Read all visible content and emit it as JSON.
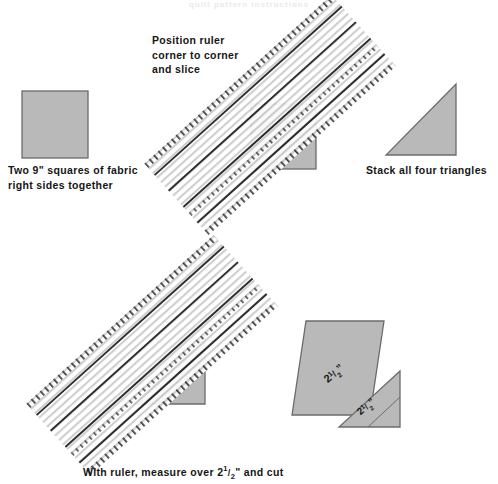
{
  "page": {
    "background_color": "#ffffff",
    "width": 498,
    "height": 484,
    "faint_header_text": "quilt pattern instructions"
  },
  "palette": {
    "fabric_fill": "#b9b9b9",
    "fabric_stroke": "#6b6b6b",
    "ruler_fill": "#ffffff",
    "ruler_hatch": "#c9c9c9",
    "ruler_guide_line": "#1f1f1f",
    "ruler_tick": "#2b2b2b",
    "text_color": "#161616"
  },
  "captions": {
    "squares": "Two 9\" squares of fabric\nright sides together",
    "position_ruler": "Position ruler\ncorner to corner\nand slice",
    "stack": "Stack all four triangles",
    "measure": "With ruler, measure over 2¹/₂\" and cut"
  },
  "measure_caption_parts": {
    "before": "With ruler, measure over ",
    "whole": "2",
    "numerator": "1",
    "slash": "/",
    "denominator": "2",
    "after": "\" and cut"
  },
  "steps": [
    {
      "id": "step-1",
      "name": "fabric-square",
      "caption_key": "squares",
      "shape": "square",
      "label": null
    },
    {
      "id": "step-2",
      "name": "ruler-over-square",
      "caption_key": "position_ruler",
      "shape": "square-with-ruler",
      "label": null
    },
    {
      "id": "step-3",
      "name": "stacked-triangles",
      "caption_key": "stack",
      "shape": "right-triangle",
      "label": null
    },
    {
      "id": "step-4",
      "name": "ruler-over-triangle",
      "caption_key": "measure",
      "shape": "triangle-with-ruler",
      "label": null
    },
    {
      "id": "step-5",
      "name": "cut-strips",
      "caption_key": null,
      "shape": "cut-pieces",
      "label": "2¹/₂\""
    }
  ],
  "measurements": {
    "square_size": "9\"",
    "strip_width": "2¹/₂\"",
    "strip_label_whole": "2",
    "strip_label_numerator": "1",
    "strip_label_denominator": "2",
    "strip_label_unit": "\"",
    "triangle_count": 4
  },
  "shapes": {
    "square_top": {
      "x": 22,
      "y": 91,
      "w": 66,
      "h": 67
    },
    "square_under_ruler": {
      "x": 251,
      "y": 104,
      "w": 65,
      "h": 65
    },
    "triangle_stack": {
      "x1": 386,
      "y1": 155,
      "x2": 456,
      "y2": 155,
      "x3": 456,
      "y3": 84
    },
    "triangle_under_ruler": {
      "x1": 134,
      "y1": 404,
      "x2": 205,
      "y2": 404,
      "x3": 205,
      "y3": 336
    },
    "ruler_top": {
      "cx": 270,
      "cy": 115,
      "w": 252,
      "h": 96,
      "angle": -42
    },
    "ruler_bottom": {
      "cx": 152,
      "cy": 355,
      "w": 252,
      "h": 96,
      "angle": -42
    },
    "strip_piece": {
      "points": "292,415 370,415 384,321 306,321"
    },
    "triangle_piece": {
      "points": "339,427 400,427 400,371"
    }
  },
  "ruler_detail": {
    "hatch_line_count": 30,
    "guide_line_count": 4,
    "tick_count": 24,
    "edge_tick_length": 6
  }
}
